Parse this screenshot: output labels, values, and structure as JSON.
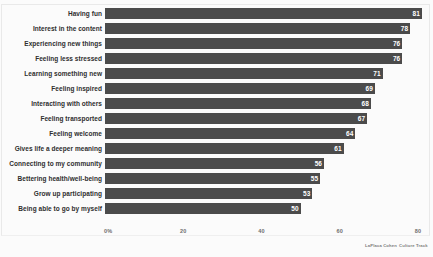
{
  "chart_data": {
    "type": "bar",
    "orientation": "horizontal",
    "title": "",
    "subtitle": "",
    "xlabel": "",
    "ylabel": "",
    "xlim": [
      0,
      80
    ],
    "grid": false,
    "legend": null,
    "value_labels_inside_bars": true,
    "bar_color": "#4b4b4b",
    "categories": [
      "Having fun",
      "Interest in the content",
      "Experiencing new things",
      "Feeling less stressed",
      "Learning something new",
      "Feeling inspired",
      "Interacting with others",
      "Feeling transported",
      "Feeling welcome",
      "Gives life a deeper meaning",
      "Connecting to my community",
      "Bettering health/well-being",
      "Grow up participating",
      "Being able to go by myself"
    ],
    "values": [
      81,
      78,
      76,
      76,
      71,
      69,
      68,
      67,
      64,
      61,
      56,
      55,
      53,
      50
    ],
    "xticks": [
      "0%",
      "20",
      "40",
      "60",
      "80"
    ],
    "xtick_values": [
      0,
      20,
      40,
      60,
      80
    ]
  },
  "footer": {
    "credit_primary": "LaPlaca Cohen",
    "credit_secondary": "Culture Track"
  }
}
